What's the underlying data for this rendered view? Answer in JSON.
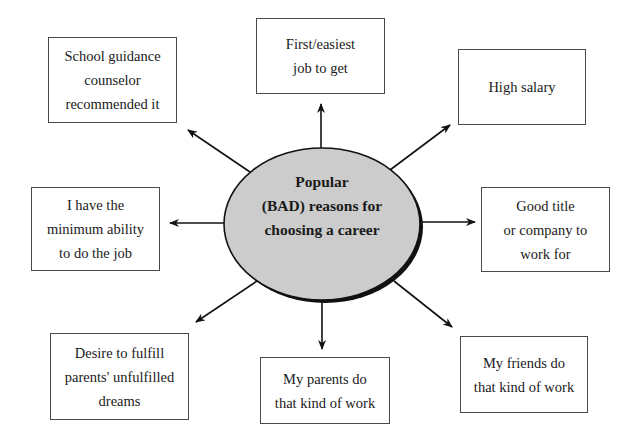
{
  "diagram": {
    "center": {
      "lines": [
        "Popular",
        "(BAD) reasons for",
        "choosing a career"
      ],
      "fill": "#cccccc",
      "shadow": "#111111"
    },
    "reasons": [
      {
        "id": "counselor",
        "lines": [
          "School guidance",
          "counselor",
          "recommended it"
        ]
      },
      {
        "id": "easiest-job",
        "lines": [
          "First/easiest",
          "job to get"
        ]
      },
      {
        "id": "high-salary",
        "lines": [
          "High salary"
        ]
      },
      {
        "id": "minimum-ability",
        "lines": [
          "I have the",
          "minimum ability",
          "to do the job"
        ]
      },
      {
        "id": "good-title",
        "lines": [
          "Good title",
          "or company to",
          "work for"
        ]
      },
      {
        "id": "parents-dreams",
        "lines": [
          "Desire to fulfill",
          "parents' unfulfilled",
          "dreams"
        ]
      },
      {
        "id": "parents-work",
        "lines": [
          "My parents do",
          "that kind of work"
        ]
      },
      {
        "id": "friends-work",
        "lines": [
          "My friends do",
          "that kind of work"
        ]
      }
    ]
  }
}
